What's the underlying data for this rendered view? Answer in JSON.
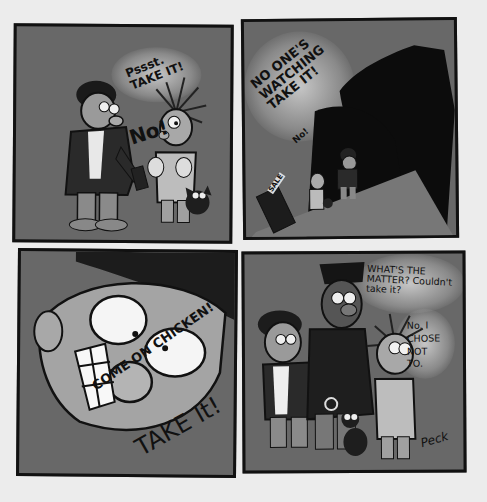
{
  "comic": {
    "panels": [
      {
        "id": 1,
        "speech": [
          {
            "speaker": "man-in-cap",
            "text": "Pssst.\nTAKE IT!"
          },
          {
            "speaker": "boy",
            "text": "No!"
          }
        ]
      },
      {
        "id": 2,
        "speech": [
          {
            "speaker": "man-in-cap",
            "text": "NO ONE'S\nWATCHING\nTAKE IT!"
          },
          {
            "speaker": "boy",
            "text": "No!"
          }
        ],
        "sign": "SALE"
      },
      {
        "id": 3,
        "speech": [
          {
            "speaker": "man-in-cap",
            "text": "COME ON CHICKEN!"
          },
          {
            "speaker": "man-in-cap",
            "text": "TAKE It!"
          }
        ]
      },
      {
        "id": 4,
        "speech": [
          {
            "speaker": "police-officer",
            "text": "WHAT'S THE\nMATTER? Couldn't\ntake it?"
          },
          {
            "speaker": "boy",
            "text": "No. I\nCHOSE\nNOT\nTO."
          }
        ],
        "signature": "Peck"
      }
    ],
    "colors": {
      "page": "#ececec",
      "panel_fill": "#686868",
      "ink": "#111111"
    }
  }
}
